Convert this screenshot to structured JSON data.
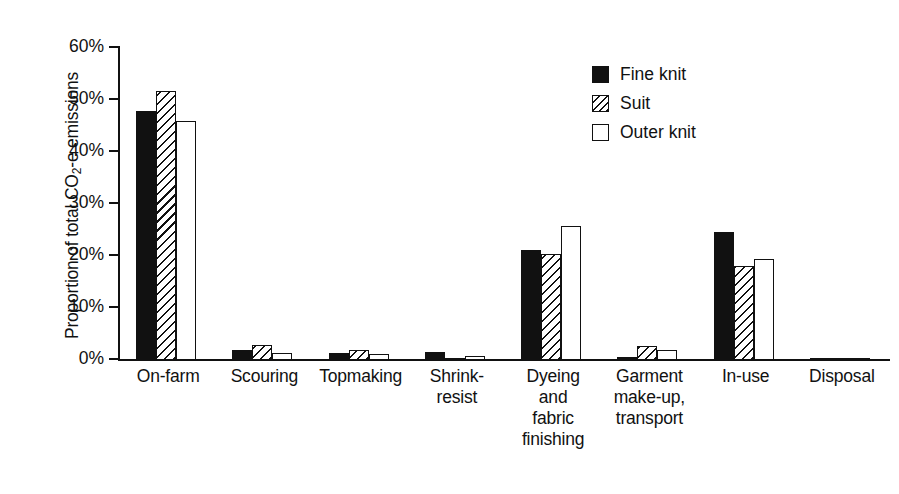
{
  "chart_data": {
    "type": "bar",
    "title": "",
    "xlabel": "",
    "ylabel": "Proportion of total CO2-e emissions",
    "ylabel_parts": {
      "pre": "Proportion of total CO",
      "sub": "2",
      "post": "-e emissions"
    },
    "ylim": [
      0,
      60
    ],
    "ytick_values": [
      0,
      10,
      20,
      30,
      40,
      50,
      60
    ],
    "ytick_labels": [
      "0%",
      "10%",
      "20%",
      "30%",
      "40%",
      "50%",
      "60%"
    ],
    "grid": false,
    "legend_position": "upper right",
    "categories": [
      "On-farm",
      "Scouring",
      "Topmaking",
      "Shrink-\nresist",
      "Dyeing\nand\nfabric\nfinishing",
      "Garment\nmake-up,\ntransport",
      "In-use",
      "Disposal"
    ],
    "category_lines": [
      [
        "On-farm"
      ],
      [
        "Scouring"
      ],
      [
        "Topmaking"
      ],
      [
        "Shrink-",
        "resist"
      ],
      [
        "Dyeing",
        "and",
        "fabric",
        "finishing"
      ],
      [
        "Garment",
        "make-up,",
        "transport"
      ],
      [
        "In-use"
      ],
      [
        "Disposal"
      ]
    ],
    "series": [
      {
        "name": "Fine knit",
        "pattern": "solid-black",
        "values": [
          47.8,
          2.0,
          1.3,
          1.5,
          21.2,
          0.6,
          24.7,
          0.3
        ]
      },
      {
        "name": "Suit",
        "pattern": "diagonal-hatch",
        "values": [
          51.8,
          2.9,
          1.9,
          0.1,
          20.3,
          2.6,
          18.0,
          0.1
        ]
      },
      {
        "name": "Outer knit",
        "pattern": "white-open",
        "values": [
          45.9,
          1.3,
          1.2,
          0.8,
          25.8,
          2.0,
          19.4,
          0.1
        ]
      }
    ],
    "colors": {
      "fine_knit": "#111111",
      "suit": "#111111",
      "outer_knit": "#ffffff",
      "axis": "#111111",
      "background": "#ffffff"
    }
  },
  "legend": {
    "items": [
      {
        "label": "Fine knit"
      },
      {
        "label": "Suit"
      },
      {
        "label": "Outer knit"
      }
    ]
  }
}
